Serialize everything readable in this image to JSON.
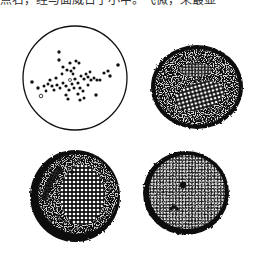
{
  "figure": {
    "top_text_fragment": "点右，经与面威日于小中。飞微，来最显",
    "panels": [
      {
        "id": "a",
        "style": "outline-with-scattered-dots",
        "cx": 75,
        "cy": 78,
        "r": 52
      },
      {
        "id": "b",
        "style": "dark-stippled-with-light-reticulate-center",
        "cx": 197,
        "cy": 87,
        "rx": 46,
        "ry": 42
      },
      {
        "id": "c",
        "style": "dark-stippled-with-light-reticulate-center",
        "cx": 75,
        "cy": 196,
        "rx": 45,
        "ry": 46
      },
      {
        "id": "d",
        "style": "dark-stippled-with-central-spot",
        "cx": 186,
        "cy": 193,
        "rx": 43,
        "ry": 42
      }
    ],
    "colors": {
      "ink": "#111111",
      "paper": "#ffffff"
    }
  }
}
